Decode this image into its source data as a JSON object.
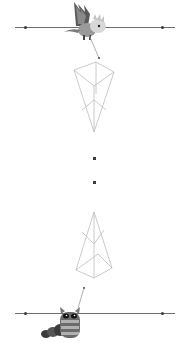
{
  "scene": {
    "width": 188,
    "height": 350,
    "background": "#ffffff",
    "line_color": "#6e6e6e",
    "wire_color": "#bdbdbd"
  },
  "top_track": {
    "y": 27,
    "x_start": 15,
    "x_end": 175,
    "dots": [
      25,
      162
    ]
  },
  "bottom_track": {
    "y": 313,
    "x_start": 15,
    "x_end": 175,
    "dots": [
      25,
      162
    ]
  },
  "creatures": [
    {
      "name": "dragon",
      "x": 68,
      "y": 2
    },
    {
      "name": "caterpillar",
      "x": 40,
      "y": 305
    }
  ],
  "center_dots": [
    {
      "x": 94,
      "y": 158
    },
    {
      "x": 94,
      "y": 182
    }
  ],
  "prisms": [
    {
      "name": "top-prism",
      "x": 72,
      "y": 60
    },
    {
      "name": "bottom-prism",
      "x": 72,
      "y": 210
    }
  ]
}
